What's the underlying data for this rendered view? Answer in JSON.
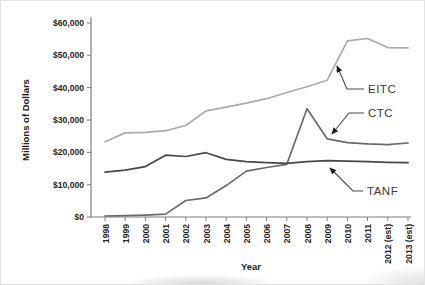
{
  "figure": {
    "y_axis_title": "Millions of Dollars",
    "x_axis_title": "Year"
  },
  "chart_data": {
    "type": "line",
    "title": "",
    "xlabel": "Year",
    "ylabel": "Millions of Dollars",
    "ylim": [
      0,
      60000
    ],
    "grid": false,
    "legend_position": "inline labels at right with leader arrows",
    "x": [
      "1998",
      "1999",
      "2000",
      "2001",
      "2002",
      "2003",
      "2004",
      "2005",
      "2006",
      "2007",
      "2008",
      "2009",
      "2010",
      "2011",
      "2012 (est)",
      "2013 (est)"
    ],
    "y_tick_values": [
      0,
      10000,
      20000,
      30000,
      40000,
      50000,
      60000
    ],
    "y_tick_labels": [
      "$0",
      "$10,000",
      "$20,000",
      "$30,000",
      "$40,000",
      "$50,000",
      "$60,000"
    ],
    "series": [
      {
        "name": "EITC",
        "color": "#ababab",
        "values": [
          23300,
          26000,
          26200,
          26700,
          28300,
          32800,
          34000,
          35200,
          36600,
          38500,
          40300,
          42300,
          54500,
          55200,
          52400,
          52300
        ]
      },
      {
        "name": "CTC",
        "color": "#6a6a6a",
        "values": [
          300,
          400,
          600,
          900,
          5100,
          5900,
          9700,
          14200,
          15300,
          16300,
          33500,
          24200,
          23000,
          22600,
          22400,
          22900
        ]
      },
      {
        "name": "TANF",
        "color": "#484848",
        "values": [
          13900,
          14500,
          15600,
          19100,
          18700,
          19900,
          17800,
          17100,
          16800,
          16600,
          17100,
          17400,
          17300,
          17100,
          16900,
          16800
        ]
      }
    ]
  }
}
